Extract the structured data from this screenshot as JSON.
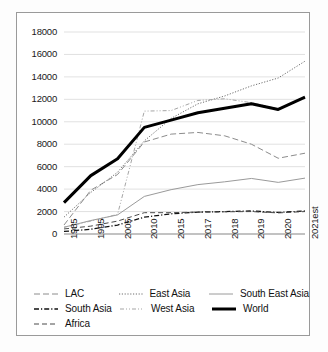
{
  "chart_data": {
    "type": "line",
    "title": "",
    "subtitle": "",
    "xlabel": "",
    "ylabel": "",
    "ylim": [
      0,
      18000
    ],
    "ytick_step": 2000,
    "grid": true,
    "legend_position": "bottom",
    "categories": [
      "1985",
      "1995",
      "2005",
      "2010",
      "2015",
      "2017",
      "2018",
      "2019",
      "2020",
      "2021est"
    ],
    "ytick_labels": [
      "18000",
      "16000",
      "14000",
      "12000",
      "10000",
      "8000",
      "6000",
      "4000",
      "2000",
      "0"
    ],
    "series": [
      {
        "name": "LAC",
        "style": "long-dash",
        "width": 1.0,
        "color": "#8c8c8c",
        "values": [
          800,
          3900,
          5300,
          8200,
          8900,
          9050,
          8750,
          8000,
          6750,
          7200
        ]
      },
      {
        "name": "East Asia",
        "style": "fine-dot",
        "width": 1.0,
        "color": "#6e6e6e",
        "values": [
          1500,
          3700,
          5500,
          8300,
          10300,
          11600,
          12300,
          13200,
          13900,
          15400
        ]
      },
      {
        "name": "South East Asia",
        "style": "solid",
        "width": 1.0,
        "color": "#9a9a9a",
        "values": [
          600,
          1200,
          1700,
          3350,
          3950,
          4400,
          4650,
          4950,
          4600,
          4980
        ]
      },
      {
        "name": "South Asia",
        "style": "dash-dot",
        "width": 1.3,
        "color": "#111111",
        "values": [
          230,
          420,
          800,
          1500,
          1800,
          1950,
          2000,
          2050,
          1920,
          2050
        ]
      },
      {
        "name": "West Asia",
        "style": "dash-dot-dot",
        "width": 1.0,
        "color": "#a5a5a5",
        "values": [
          600,
          1150,
          1750,
          10950,
          11000,
          11900,
          12050,
          11700,
          11150,
          12200
        ]
      },
      {
        "name": "World",
        "style": "solid-bold",
        "width": 3.0,
        "color": "#000000",
        "values": [
          2800,
          5200,
          6700,
          9500,
          10150,
          10800,
          11200,
          11600,
          11100,
          12200
        ]
      },
      {
        "name": "Africa",
        "style": "dash",
        "width": 1.0,
        "color": "#4a4a4a",
        "values": [
          450,
          700,
          1150,
          1900,
          1900,
          1950,
          1980,
          2000,
          1880,
          2000
        ]
      }
    ],
    "legend_entries": [
      {
        "label": "LAC",
        "style": "long-dash"
      },
      {
        "label": "East Asia",
        "style": "fine-dot"
      },
      {
        "label": "South East Asia",
        "style": "solid"
      },
      {
        "label": "South Asia",
        "style": "dash-dot"
      },
      {
        "label": "West Asia",
        "style": "dash-dot-dot"
      },
      {
        "label": "World",
        "style": "solid-bold"
      },
      {
        "label": "Africa",
        "style": "dash"
      }
    ]
  },
  "colors": {
    "frame": "#9a9a9a",
    "grid": "#d9d9d9",
    "axis": "#868686",
    "text": "#1a1a1a",
    "world": "#000000"
  }
}
